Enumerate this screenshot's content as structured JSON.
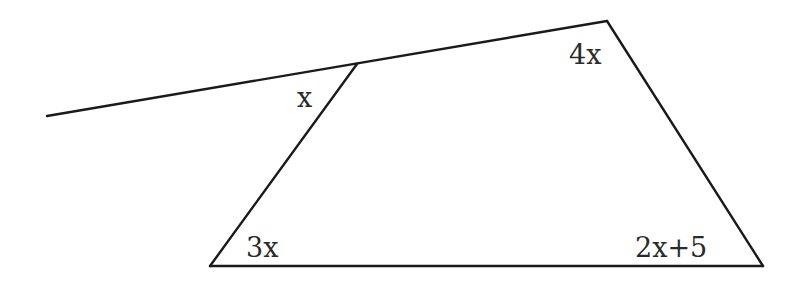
{
  "figure": {
    "type": "geometry-diagram",
    "stroke_color": "#1a1a1a",
    "background": "#ffffff",
    "points": {
      "line_end": [
        47,
        116
      ],
      "top_left": [
        357,
        64
      ],
      "top_right": [
        607,
        21
      ],
      "bottom_right": [
        763,
        266
      ],
      "bottom_left": [
        210,
        266
      ]
    },
    "angles": {
      "exterior_top_left": {
        "label": "x",
        "pos": [
          297,
          107
        ]
      },
      "top_right": {
        "label": "4x",
        "pos": [
          569,
          64
        ]
      },
      "bottom_left": {
        "label": "3x",
        "pos": [
          246,
          257
        ]
      },
      "bottom_right": {
        "label": "2x+5",
        "pos": [
          635,
          257
        ]
      }
    }
  }
}
